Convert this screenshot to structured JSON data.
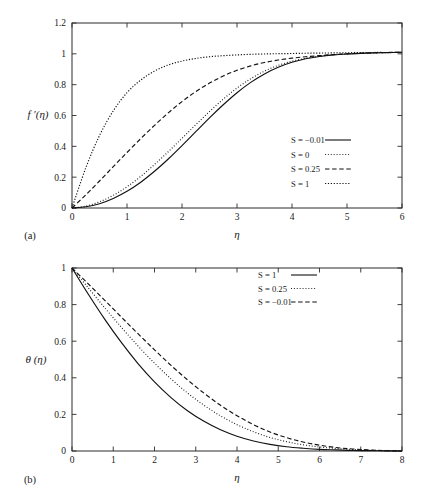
{
  "figure": {
    "background": "#ffffff",
    "ink": "#111111"
  },
  "panels": [
    {
      "tag": "(a)",
      "xlabel": "η",
      "ylabel": "f ′(η)"
    },
    {
      "tag": "(b)",
      "xlabel": "η",
      "ylabel": "θ (η)"
    }
  ],
  "chart_data": [
    {
      "type": "line",
      "title": "",
      "panel": "(a)",
      "xlabel": "η",
      "ylabel": "f ′(η)",
      "xlim": [
        0,
        6
      ],
      "ylim": [
        0,
        1.2
      ],
      "xticks": [
        0,
        1,
        2,
        3,
        4,
        5,
        6
      ],
      "xticklabels": [
        "0",
        "1",
        "2",
        "3",
        "4",
        "5",
        "6"
      ],
      "yticks": [
        0,
        0.2,
        0.4,
        0.6,
        0.8,
        1,
        1.2
      ],
      "yticklabels": [
        "0",
        "0.2",
        "0.4",
        "0.6",
        "0.8",
        "1",
        "1.2"
      ],
      "grid": false,
      "legend_position": "center-right",
      "series": [
        {
          "name": "S = −0.01",
          "label": "S = −0.01",
          "style": "solid",
          "x": [
            0,
            0.25,
            0.5,
            0.75,
            1,
            1.25,
            1.5,
            1.75,
            2,
            2.25,
            2.5,
            2.75,
            3,
            3.25,
            3.5,
            3.75,
            4,
            4.25,
            4.5,
            4.75,
            5,
            5.25,
            5.5,
            5.75,
            6
          ],
          "values": [
            0.0,
            0.008,
            0.028,
            0.062,
            0.108,
            0.167,
            0.238,
            0.318,
            0.405,
            0.495,
            0.585,
            0.67,
            0.748,
            0.815,
            0.87,
            0.913,
            0.945,
            0.968,
            0.983,
            0.993,
            0.999,
            1.003,
            1.006,
            1.008,
            1.01
          ]
        },
        {
          "name": "S = 0",
          "label": "S = 0",
          "style": "dotted",
          "x": [
            0,
            0.25,
            0.5,
            0.75,
            1,
            1.25,
            1.5,
            1.75,
            2,
            2.25,
            2.5,
            2.75,
            3,
            3.25,
            3.5,
            3.75,
            4,
            4.25,
            4.5,
            4.75,
            5,
            5.25,
            5.5,
            5.75,
            6
          ],
          "values": [
            0.0,
            0.012,
            0.04,
            0.082,
            0.138,
            0.205,
            0.282,
            0.365,
            0.452,
            0.54,
            0.626,
            0.706,
            0.778,
            0.839,
            0.888,
            0.925,
            0.952,
            0.971,
            0.984,
            0.993,
            0.999,
            1.003,
            1.006,
            1.008,
            1.01
          ]
        },
        {
          "name": "S = 0.25",
          "label": "S = 0.25",
          "style": "dashed",
          "x": [
            0,
            0.25,
            0.5,
            0.75,
            1,
            1.25,
            1.5,
            1.75,
            2,
            2.25,
            2.5,
            2.75,
            3,
            3.25,
            3.5,
            3.75,
            4,
            4.25,
            4.5,
            4.75,
            5,
            5.25,
            5.5,
            5.75,
            6
          ],
          "values": [
            0.0,
            0.085,
            0.175,
            0.268,
            0.36,
            0.45,
            0.536,
            0.617,
            0.69,
            0.755,
            0.81,
            0.856,
            0.893,
            0.922,
            0.944,
            0.96,
            0.972,
            0.981,
            0.988,
            0.995,
            1.0,
            1.004,
            1.007,
            1.009,
            1.01
          ]
        },
        {
          "name": "S = 1",
          "label": "S = 1",
          "style": "dashdot",
          "x": [
            0,
            0.25,
            0.5,
            0.75,
            1,
            1.25,
            1.5,
            1.75,
            2,
            2.25,
            2.5,
            2.75,
            3,
            3.25,
            3.5,
            3.75,
            4,
            4.25,
            4.5,
            4.75,
            5,
            5.25,
            5.5,
            5.75,
            6
          ],
          "values": [
            0.0,
            0.26,
            0.47,
            0.63,
            0.748,
            0.83,
            0.888,
            0.928,
            0.953,
            0.97,
            0.981,
            0.988,
            0.993,
            0.997,
            0.999,
            1.001,
            1.002,
            1.004,
            1.005,
            1.006,
            1.007,
            1.008,
            1.009,
            1.009,
            1.01
          ]
        }
      ]
    },
    {
      "type": "line",
      "title": "",
      "panel": "(b)",
      "xlabel": "η",
      "ylabel": "θ (η)",
      "xlim": [
        0,
        8
      ],
      "ylim": [
        0,
        1
      ],
      "xticks": [
        0,
        1,
        2,
        3,
        4,
        5,
        6,
        7,
        8
      ],
      "xticklabels": [
        "0",
        "1",
        "2",
        "3",
        "4",
        "5",
        "6",
        "7",
        "8"
      ],
      "yticks": [
        0,
        0.2,
        0.4,
        0.6,
        0.8,
        1
      ],
      "yticklabels": [
        "0",
        "0.2",
        "0.4",
        "0.6",
        "0.8",
        "1"
      ],
      "grid": false,
      "legend_position": "top-right",
      "series": [
        {
          "name": "S = 1",
          "label": "S = 1",
          "style": "solid",
          "x": [
            0,
            0.4,
            0.8,
            1.2,
            1.6,
            2,
            2.4,
            2.8,
            3.2,
            3.6,
            4,
            4.4,
            4.8,
            5.2,
            5.6,
            6,
            6.4,
            6.8,
            7.2,
            7.6,
            8
          ],
          "values": [
            1.0,
            0.855,
            0.718,
            0.592,
            0.478,
            0.378,
            0.292,
            0.22,
            0.162,
            0.116,
            0.081,
            0.055,
            0.036,
            0.023,
            0.015,
            0.009,
            0.006,
            0.003,
            0.002,
            0.001,
            0.0
          ]
        },
        {
          "name": "S = 0.25",
          "label": "S = 0.25",
          "style": "dotted",
          "x": [
            0,
            0.4,
            0.8,
            1.2,
            1.6,
            2,
            2.4,
            2.8,
            3.2,
            3.6,
            4,
            4.4,
            4.8,
            5.2,
            5.6,
            6,
            6.4,
            6.8,
            7.2,
            7.6,
            8
          ],
          "values": [
            1.0,
            0.89,
            0.781,
            0.675,
            0.574,
            0.48,
            0.394,
            0.317,
            0.25,
            0.192,
            0.144,
            0.105,
            0.074,
            0.051,
            0.034,
            0.022,
            0.014,
            0.008,
            0.004,
            0.002,
            0.0
          ]
        },
        {
          "name": "S = −0.01",
          "label": "S = −0.01",
          "style": "dashed",
          "x": [
            0,
            0.4,
            0.8,
            1.2,
            1.6,
            2,
            2.4,
            2.8,
            3.2,
            3.6,
            4,
            4.4,
            4.8,
            5.2,
            5.6,
            6,
            6.4,
            6.8,
            7.2,
            7.6,
            8
          ],
          "values": [
            1.0,
            0.912,
            0.822,
            0.731,
            0.641,
            0.553,
            0.468,
            0.389,
            0.316,
            0.25,
            0.193,
            0.144,
            0.104,
            0.073,
            0.049,
            0.032,
            0.019,
            0.011,
            0.006,
            0.002,
            0.0
          ]
        }
      ]
    }
  ]
}
